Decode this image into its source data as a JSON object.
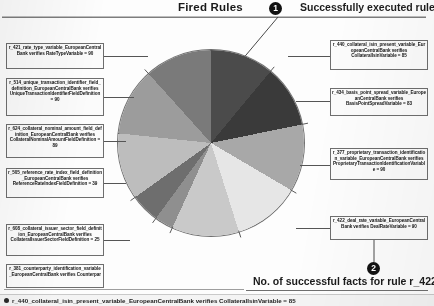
{
  "header": {
    "title": "Fired Rules",
    "badge": "1",
    "note": "Successfully executed rules"
  },
  "footer": {
    "badge": "2",
    "note": "No. of successful facts for rule r_422",
    "status_text": "r_440_collateral_isin_present_variable_EuropeanCentralBank verifies CollateralIsinVariable = 85",
    "status_icon": "bullet-dot-icon"
  },
  "left_callouts": [
    {
      "text": "r_421_rate_type_variable_EuropeanCentralBank verifies RateTypeVariable = 90"
    },
    {
      "text": "r_514_unique_transaction_identifier_field_definition_EuropeanCentralBank verifies UniqueTransactionIdentifierFieldDefinition = 90"
    },
    {
      "text": "r_624_collateral_nominal_amount_field_definition_EuropeanCentralBank verifies CollateralNominalAmountFieldDefinition = 89"
    },
    {
      "text": "r_505_reference_rate_index_field_definition_EuropeanCentralBank verifies ReferenceRateIndexFieldDefinition = 39"
    },
    {
      "text": "r_608_collateral_issuer_sector_field_definition_EuropeanCentralBank verifies CollateralIssuerSectorFieldDefinition = 25"
    },
    {
      "text": "r_381_counterparty_identification_variable_EuropeanCentralBank verifies Counterpar"
    }
  ],
  "right_callouts": [
    {
      "text": "r_440_collateral_isin_present_variable_EuropeanCentralBank verifies CollateralIsinVariable = 85"
    },
    {
      "text": "r_434_basis_point_spread_variable_EuropeanCentralBank verifies BasisPointSpreadVariable = 83"
    },
    {
      "text": "r_377_proprietary_transaction_identification_variable_EuropeanCentralBank verifies ProprietaryTransactionIdentificationVariable = 90"
    },
    {
      "text": "r_422_deal_rate_variable_EuropeanCentralBank verifies DealRateVariable = 90"
    }
  ],
  "chart_data": {
    "type": "pie",
    "title": "Fired Rules",
    "xlabel": "",
    "ylabel": "No. of successful facts for rule",
    "legend_position": "callout-labels",
    "grid": false,
    "categories": [
      "r_440_collateral_isin_present_variable",
      "r_434_basis_point_spread_variable",
      "r_377_proprietary_transaction_identification_variable",
      "r_422_deal_rate_variable",
      "r_381_counterparty_identification_variable",
      "r_608_collateral_issuer_sector_field_definition",
      "r_505_reference_rate_index_field_definition",
      "r_624_collateral_nominal_amount_field_definition",
      "r_514_unique_transaction_identifier_field_definition",
      "r_421_rate_type_variable"
    ],
    "values": [
      85,
      83,
      90,
      90,
      90,
      25,
      39,
      89,
      90,
      90
    ],
    "colors": [
      "#4b4b4b",
      "#3a3a3a",
      "#a8a8a8",
      "#e6e6e6",
      "#c9c9c9",
      "#8f8f8f",
      "#6e6e6e",
      "#bdbdbd",
      "#9c9c9c",
      "#7a7a7a"
    ],
    "unit": "No. of successful facts"
  }
}
